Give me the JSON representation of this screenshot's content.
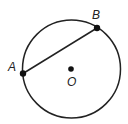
{
  "diagram": {
    "type": "circle-chord",
    "circle": {
      "center": [
        71.5,
        69
      ],
      "radius": 49,
      "stroke": "#222222"
    },
    "chord": {
      "from": "A",
      "to": "B"
    },
    "points": [
      {
        "id": "A",
        "label": "A",
        "x": 23,
        "y": 73.5,
        "label_x": 8,
        "label_y": 71
      },
      {
        "id": "B",
        "label": "B",
        "x": 97,
        "y": 28,
        "label_x": 92,
        "label_y": 19
      },
      {
        "id": "O",
        "label": "O",
        "x": 71,
        "y": 69,
        "label_x": 67,
        "label_y": 86
      }
    ]
  }
}
